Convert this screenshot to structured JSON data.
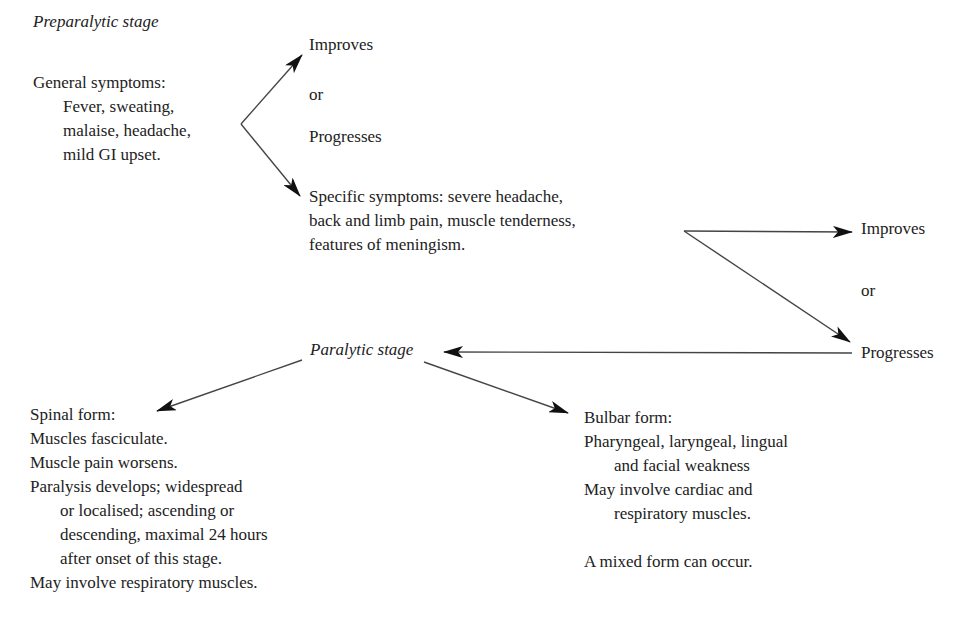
{
  "diagram": {
    "preparalytic": {
      "heading": "Preparalytic stage",
      "general": {
        "title": "General symptoms:",
        "lines": [
          "Fever, sweating,",
          "malaise, headache,",
          "mild GI upset."
        ]
      },
      "outcome1": {
        "improves": "Improves",
        "or": "or",
        "progresses": "Progresses"
      },
      "specific": {
        "lines": [
          "Specific symptoms: severe headache,",
          "back and limb pain, muscle tenderness,",
          "features of meningism."
        ]
      },
      "outcome2": {
        "improves": "Improves",
        "or": "or",
        "progresses": "Progresses"
      }
    },
    "paralytic": {
      "heading": "Paralytic stage",
      "spinal": {
        "title": "Spinal form:",
        "lines": [
          "Muscles fasciculate.",
          "Muscle pain worsens.",
          "Paralysis develops; widespread",
          "or localised; ascending or",
          "descending, maximal 24 hours",
          "after onset of this stage.",
          "May involve respiratory muscles."
        ]
      },
      "bulbar": {
        "title": "Bulbar form:",
        "lines": [
          "Pharyngeal, laryngeal, lingual",
          "and facial weakness",
          "May involve cardiac and",
          "respiratory muscles.",
          "",
          "A mixed form can occur."
        ]
      }
    },
    "colors": {
      "text": "#222222",
      "arrow": "#333333",
      "background": "#ffffff"
    }
  }
}
